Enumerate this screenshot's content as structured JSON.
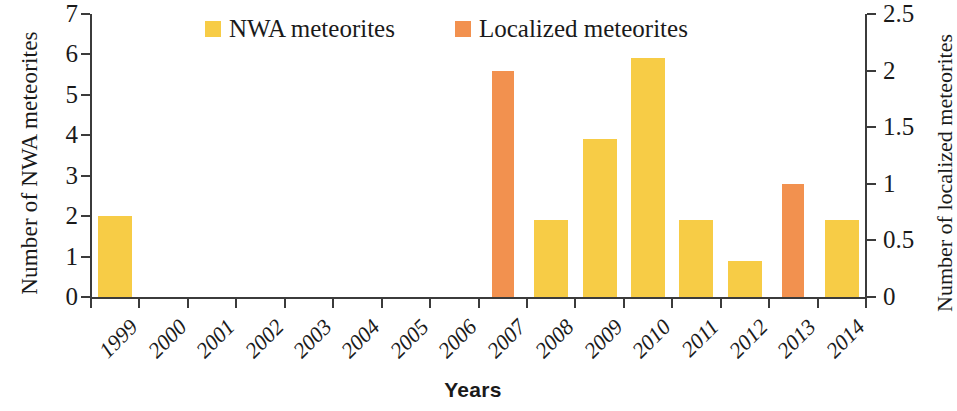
{
  "chart_data": {
    "type": "bar",
    "title": "",
    "xlabel": "Years",
    "ylabel": "Number of NWA meteorites",
    "y2label": "Number of localized meteorites",
    "categories": [
      "1999",
      "2000",
      "2001",
      "2002",
      "2003",
      "2004",
      "2005",
      "2006",
      "2007",
      "2008",
      "2009",
      "2010",
      "2011",
      "2012",
      "2013",
      "2014"
    ],
    "ylim": [
      0,
      7
    ],
    "yticks": [
      "0",
      "1",
      "2",
      "3",
      "4",
      "5",
      "6",
      "7"
    ],
    "y2lim": [
      0,
      2.5
    ],
    "y2ticks": [
      "0",
      "0.5",
      "1",
      "1.5",
      "2",
      "2.5"
    ],
    "grid": false,
    "legend_position": "top-center",
    "series": [
      {
        "name": "NWA meteorites",
        "axis": "left",
        "color": "#f7cc46",
        "values": [
          2,
          0,
          0,
          0,
          0,
          0,
          0,
          0,
          0,
          1.9,
          3.9,
          5.9,
          1.9,
          0.9,
          0,
          1.9
        ]
      },
      {
        "name": "Localized meteorites",
        "axis": "right",
        "color": "#f2914f",
        "values": [
          0,
          0,
          0,
          0,
          0,
          0,
          0,
          0,
          2,
          0,
          0,
          0,
          0,
          0,
          1,
          0
        ]
      }
    ]
  },
  "legend": {
    "items": [
      {
        "label": "NWA meteorites",
        "color": "#f7cc46",
        "key": "nwa"
      },
      {
        "label": "Localized meteorites",
        "color": "#f2914f",
        "key": "loc"
      }
    ]
  }
}
